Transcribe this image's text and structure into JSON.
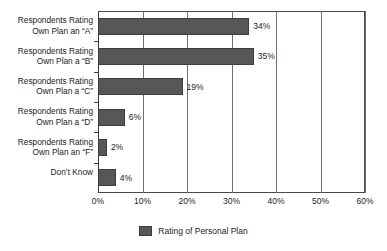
{
  "chart_data": {
    "type": "bar",
    "orientation": "horizontal",
    "title": "",
    "xlabel": "",
    "ylabel": "",
    "xlim": [
      0,
      60
    ],
    "xticks": [
      "0%",
      "10%",
      "20%",
      "30%",
      "40%",
      "50%",
      "60%"
    ],
    "xtick_values": [
      0,
      10,
      20,
      30,
      40,
      50,
      60
    ],
    "grid": true,
    "grid_axis": "x",
    "legend_position": "bottom-center",
    "categories": [
      "Respondents Rating\nOwn Plan an “A”",
      "Respondents Rating\nOwn Plan a “B”",
      "Respondents Rating\nOwn Plan a “C”",
      "Respondents Rating\nOwn Plan a “D”",
      "Respondents Rating\nOwn Plan an “F”",
      "Don’t Know"
    ],
    "values": [
      34,
      35,
      19,
      6,
      2,
      4
    ],
    "data_labels": [
      "34%",
      "35%",
      "19%",
      "6%",
      "2%",
      "4%"
    ],
    "series": [
      {
        "name": "Rating of Personal Plan",
        "color": "#575757",
        "values": [
          34,
          35,
          19,
          6,
          2,
          4
        ]
      }
    ],
    "legend": [
      {
        "label": "Rating of Personal Plan",
        "color": "#575757"
      }
    ]
  },
  "colors": {
    "bar_fill": "#575757",
    "bar_border": "#3d3d3d",
    "gridline": "#6f6f6f",
    "frame": "#4a4a4a",
    "text": "#1c1c1c",
    "background": "#ffffff"
  }
}
